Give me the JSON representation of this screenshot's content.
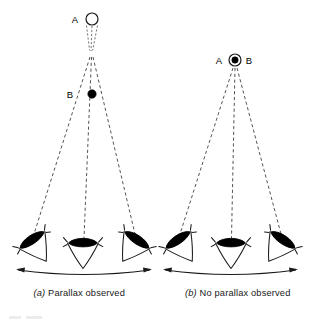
{
  "figure": {
    "background_color": "#ffffff",
    "ink_color": "#1a1a1a",
    "dash_color": "#555555",
    "width": 317,
    "height": 324
  },
  "panels": [
    {
      "id": "a",
      "caption_tag": "(a)",
      "caption_text": "Parallax observed",
      "caption_full": "(a) Parallax observed",
      "objects": [
        {
          "name": "A",
          "label": "A",
          "marker": "open-circle",
          "description": "distant star A, open circle",
          "x": 92,
          "y": 19,
          "radius": 6,
          "label_x": 75,
          "label_y": 21
        },
        {
          "name": "B",
          "label": "B",
          "marker": "filled-circle",
          "description": "nearby star B, filled circle",
          "x": 92,
          "y": 94,
          "radius": 4.2,
          "label_x": 70,
          "label_y": 97
        }
      ],
      "convergence_point": {
        "x": 91,
        "y": 56
      },
      "observers": [
        {
          "name": "left-eye",
          "x": 32,
          "y": 240,
          "rotation": -34
        },
        {
          "name": "center-eye",
          "x": 83,
          "y": 243,
          "rotation": 0
        },
        {
          "name": "right-eye",
          "x": 137,
          "y": 240,
          "rotation": 34
        }
      ],
      "baseline": {
        "left_x": 16,
        "right_x": 152,
        "y": 271,
        "sag": 7,
        "arrowheads": "both"
      }
    },
    {
      "id": "b",
      "caption_tag": "(b)",
      "caption_text": "No parallax observed",
      "caption_full": "(b) No parallax observed",
      "objects": [
        {
          "name": "A",
          "label": "A",
          "marker": "open-circle",
          "description": "distant star A, open circle coincident with B",
          "x": 235,
          "y": 60,
          "radius": 6,
          "label_x": 219,
          "label_y": 62
        },
        {
          "name": "B",
          "label": "B",
          "marker": "filled-circle",
          "description": "nearby star B, filled dot inside A",
          "x": 235,
          "y": 60,
          "radius": 3.2,
          "label_x": 246,
          "label_y": 62
        }
      ],
      "convergence_point": {
        "x": 235,
        "y": 60
      },
      "observers": [
        {
          "name": "left-eye",
          "x": 178,
          "y": 240,
          "rotation": -34
        },
        {
          "name": "center-eye",
          "x": 231,
          "y": 243,
          "rotation": 0
        },
        {
          "name": "right-eye",
          "x": 283,
          "y": 240,
          "rotation": 34
        }
      ],
      "baseline": {
        "left_x": 163,
        "right_x": 298,
        "y": 271,
        "sag": 7,
        "arrowheads": "both"
      }
    }
  ]
}
